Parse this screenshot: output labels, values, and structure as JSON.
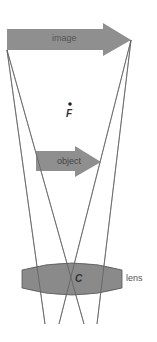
{
  "diagram": {
    "type": "ray-diagram",
    "labels": {
      "image": "image",
      "object": "object",
      "focal_point": "F",
      "center": "C",
      "lens": "lens"
    },
    "colors": {
      "arrow_fill": "#8f8f8f",
      "lens_fill": "#8a8a8a",
      "lens_stroke": "#555555",
      "ray_stroke": "#6a6a6a",
      "text": "#333333"
    }
  }
}
